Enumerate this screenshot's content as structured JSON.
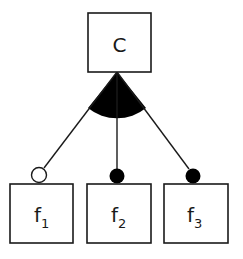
{
  "diagram": {
    "type": "feature-model",
    "root": {
      "label": "C"
    },
    "group": {
      "type": "or-group",
      "marker": "filled-arc"
    },
    "children": [
      {
        "label": "f",
        "subscript": "1",
        "connector": "optional",
        "connector_fill": "hollow"
      },
      {
        "label": "f",
        "subscript": "2",
        "connector": "mandatory",
        "connector_fill": "filled"
      },
      {
        "label": "f",
        "subscript": "3",
        "connector": "mandatory",
        "connector_fill": "filled"
      }
    ],
    "colors": {
      "stroke": "#1a1a1a",
      "background": "#ffffff",
      "fill": "#000000"
    }
  }
}
